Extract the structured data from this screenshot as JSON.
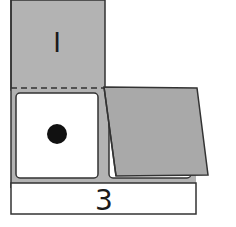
{
  "diagram": {
    "top_panel_label": "I",
    "bottom_label": "3",
    "colors": {
      "panel_gray": "#b3b3b3",
      "flap_gray": "#a9a9a9",
      "stroke": "#333333",
      "window_white": "#ffffff",
      "dot": "#111111"
    },
    "elements": [
      "top-panel-marked-I",
      "dashed-fold-line",
      "left-window-with-dot",
      "right-folded-flap",
      "bottom-label-box-3"
    ]
  }
}
